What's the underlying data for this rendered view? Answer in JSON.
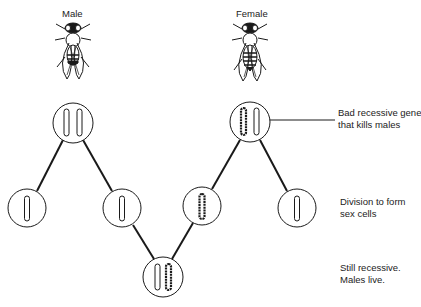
{
  "labels": {
    "male": "Male",
    "female": "Female"
  },
  "annotations": {
    "bad_gene": [
      "Bad recessive gene",
      "that kills males"
    ],
    "division": [
      "Division to form",
      "sex cells"
    ],
    "still_recessive": [
      "Still recessive.",
      "Males live."
    ]
  },
  "colors": {
    "ink": "#1a1a1a",
    "background": "#ffffff"
  }
}
